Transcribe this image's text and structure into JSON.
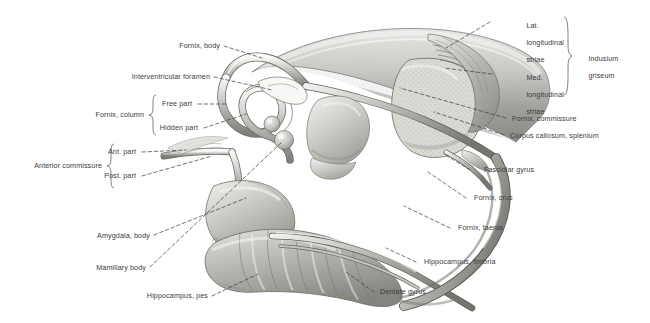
{
  "figure": {
    "type": "anatomical-illustration",
    "background_color": "#ffffff",
    "text_color": "#3c3c3c",
    "leader_line_color": "#3a3a3a"
  },
  "labels": {
    "fornix_body": "Fornix, body",
    "interventricular_foramen": "Interventricular foramen",
    "fornix_column": "Fornix, column",
    "free_part": "Free part",
    "hidden_part": "Hidden part",
    "anterior_commissure": "Anterior commissure",
    "ant_part": "Ant. part",
    "post_part": "Post. part",
    "amygdala_body": "Amygdala, body",
    "mamillary_body": "Mamillary body",
    "hippocampus_pes": "Hippocampus, pes",
    "dentate_gyrus": "Dentate gyrus",
    "lat_longitudinal_striae_1": "Lat.",
    "lat_longitudinal_striae_2": "longitudinal",
    "lat_longitudinal_striae_3": "striae",
    "med_longitudinal_striae_1": "Med.",
    "med_longitudinal_striae_2": "longitudinal",
    "med_longitudinal_striae_3": "striae",
    "indusium_griseum_1": "Indusium",
    "indusium_griseum_2": "griseum",
    "fornix_commissure": "Fornix, commissure",
    "corpus_callosum_splenium": "Corpus callosum, splenium",
    "fasciolar_gyrus": "Fasciolar gyrus",
    "fornix_crus": "Fornix, crus",
    "fornix_taenia": "Fornix, taenia",
    "hippocampus_fimbria": "Hippocampus, fimbria"
  }
}
